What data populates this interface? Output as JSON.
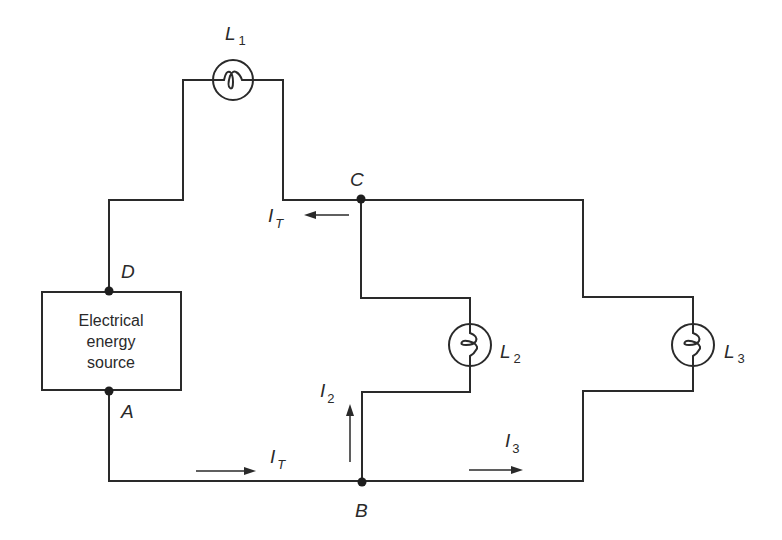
{
  "diagram": {
    "type": "parallel-series circuit",
    "source": {
      "lines": [
        "Electrical",
        "energy",
        "source"
      ]
    },
    "nodes": {
      "A": "A",
      "B": "B",
      "C": "C",
      "D": "D"
    },
    "lamps": [
      {
        "letter": "L",
        "sub": "1"
      },
      {
        "letter": "L",
        "sub": "2"
      },
      {
        "letter": "L",
        "sub": "3"
      }
    ],
    "currents": {
      "total_top": {
        "letter": "I",
        "sub": "T"
      },
      "total_bottom": {
        "letter": "I",
        "sub": "T"
      },
      "branch2": {
        "letter": "I",
        "sub": "2"
      },
      "branch3": {
        "letter": "I",
        "sub": "3"
      }
    },
    "colors": {
      "ink": "#2a2a2a",
      "background": "#ffffff"
    }
  }
}
